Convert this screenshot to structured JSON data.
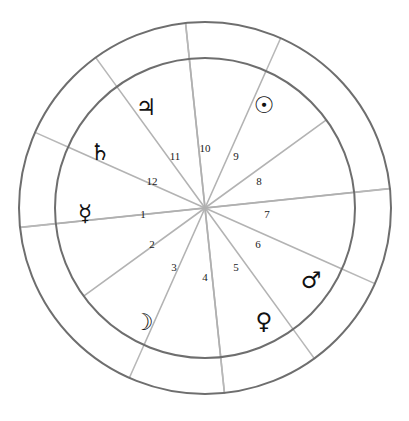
{
  "chart": {
    "type": "astrological-wheel",
    "geometry": {
      "center_x": 205,
      "center_y": 208,
      "outer_radius": 186,
      "inner_radius": 150,
      "house_count": 12
    },
    "colors": {
      "background": "#ffffff",
      "ring_stroke": "#6e6e6e",
      "spoke_stroke": "#b3b3b3",
      "text": "#1a1a1a"
    },
    "houses": [
      {
        "number": "1",
        "label_x": 143,
        "label_y": 215,
        "cusp_angle": 186
      },
      {
        "number": "2",
        "label_x": 152,
        "label_y": 245,
        "cusp_angle": 216
      },
      {
        "number": "3",
        "label_x": 174,
        "label_y": 268,
        "cusp_angle": 246
      },
      {
        "number": "4",
        "label_x": 205,
        "label_y": 278,
        "cusp_angle": 276
      },
      {
        "number": "5",
        "label_x": 236,
        "label_y": 268,
        "cusp_angle": 306
      },
      {
        "number": "6",
        "label_x": 258,
        "label_y": 245,
        "cusp_angle": 336
      },
      {
        "number": "7",
        "label_x": 267,
        "label_y": 215,
        "cusp_angle": 6
      },
      {
        "number": "8",
        "label_x": 259,
        "label_y": 182,
        "cusp_angle": 36
      },
      {
        "number": "9",
        "label_x": 236,
        "label_y": 157,
        "cusp_angle": 66
      },
      {
        "number": "10",
        "label_x": 205,
        "label_y": 149,
        "cusp_angle": 96
      },
      {
        "number": "11",
        "label_x": 175,
        "label_y": 157,
        "cusp_angle": 126
      },
      {
        "number": "12",
        "label_x": 152,
        "label_y": 182,
        "cusp_angle": 156
      }
    ],
    "planets": [
      {
        "name": "jupiter",
        "glyph": "♃",
        "label": "Jupiter",
        "x": 146,
        "y": 108
      },
      {
        "name": "sun",
        "glyph": "☉",
        "label": "Sun",
        "x": 264,
        "y": 106
      },
      {
        "name": "saturn",
        "glyph": "♄",
        "label": "Saturn",
        "x": 100,
        "y": 153
      },
      {
        "name": "mercury",
        "glyph": "☿",
        "label": "Mercury",
        "x": 85,
        "y": 214
      },
      {
        "name": "moon",
        "glyph": "☽",
        "label": "Moon",
        "x": 143,
        "y": 323
      },
      {
        "name": "venus",
        "glyph": "♀",
        "label": "Venus",
        "x": 264,
        "y": 322
      },
      {
        "name": "mars",
        "glyph": "♂",
        "label": "Mars",
        "x": 311,
        "y": 281
      }
    ],
    "ring_spokes": [
      {
        "name": "ring-spoke-ne-upper",
        "angle": 66
      },
      {
        "name": "ring-spoke-n",
        "angle": 96
      },
      {
        "name": "ring-spoke-nw",
        "angle": 126
      },
      {
        "name": "ring-spoke-w-upper",
        "angle": 156
      },
      {
        "name": "ring-spoke-w-lower",
        "angle": 186
      },
      {
        "name": "ring-spoke-sw",
        "angle": 246
      },
      {
        "name": "ring-spoke-s",
        "angle": 276
      },
      {
        "name": "ring-spoke-se",
        "angle": 306
      },
      {
        "name": "ring-spoke-e-lower",
        "angle": 336
      },
      {
        "name": "ring-spoke-e-upper",
        "angle": 6
      }
    ],
    "axis_lines": [
      {
        "name": "ascendant-descendant-axis",
        "angle": 6
      },
      {
        "name": "ic-mc-axis",
        "angle": 96
      }
    ]
  }
}
